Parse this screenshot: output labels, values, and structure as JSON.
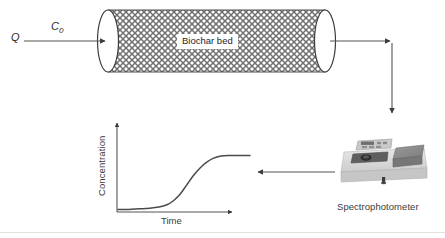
{
  "figure": {
    "background_color": "#ffffff",
    "line_color": "#555555",
    "text_color": "#2b2b2b"
  },
  "column": {
    "inlet_flow_label": "Q",
    "inlet_concentration_label": "C",
    "inlet_concentration_subscript": "0",
    "bed_label": "Biochar bed",
    "hatch_pattern": "crosshatch",
    "hatch_color": "#6a6a6a",
    "fill_color": "#ffffff"
  },
  "graph": {
    "y_axis_label": "Concentration",
    "x_axis_label": "Time",
    "curve_shape": "sigmoid-breakthrough"
  },
  "instrument": {
    "caption": "Spectrophotometer",
    "body_color": "#dcdcdc",
    "lid_color": "#8c8c8c",
    "panel_color": "#c9c9c9"
  },
  "chart_data": {
    "type": "line",
    "title": "",
    "xlabel": "Time",
    "ylabel": "Concentration",
    "xlim": [
      0,
      1
    ],
    "ylim": [
      0,
      1
    ],
    "grid": false,
    "legend": "none",
    "annotations": [
      "Sigmoidal breakthrough curve: effluent concentration rises from ~0 to plateau at inlet concentration"
    ],
    "series": [
      {
        "name": "Effluent concentration",
        "x": [
          0.0,
          0.08,
          0.16,
          0.24,
          0.31,
          0.37,
          0.42,
          0.47,
          0.52,
          0.57,
          0.62,
          0.67,
          0.72,
          0.78,
          0.85,
          0.92,
          1.0
        ],
        "values": [
          0.01,
          0.01,
          0.02,
          0.03,
          0.05,
          0.09,
          0.16,
          0.27,
          0.43,
          0.59,
          0.72,
          0.82,
          0.89,
          0.93,
          0.94,
          0.94,
          0.94
        ]
      }
    ]
  }
}
